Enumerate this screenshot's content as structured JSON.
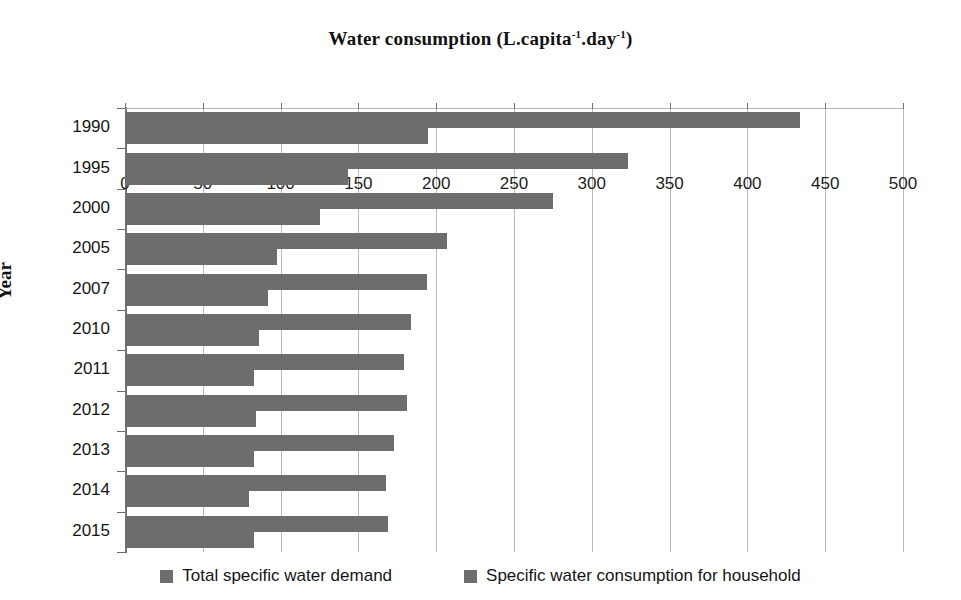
{
  "chart_data": {
    "type": "bar",
    "orientation": "horizontal",
    "title": "Water consumption (L.capita-1.day-1)",
    "title_parts": {
      "main": "Water consumption (L.capita",
      "sup1": "-1",
      "mid": ".day",
      "sup2": "-1",
      "end": ")"
    },
    "xlabel": "Water consumption (L.capita-1.day-1)",
    "ylabel": "Year",
    "xlim": [
      0,
      500
    ],
    "ylim_categories": [
      "1990",
      "1995",
      "2000",
      "2005",
      "2007",
      "2010",
      "2011",
      "2012",
      "2013",
      "2014",
      "2015"
    ],
    "categories": [
      "1990",
      "1995",
      "2000",
      "2005",
      "2007",
      "2010",
      "2011",
      "2012",
      "2013",
      "2014",
      "2015"
    ],
    "xticks": [
      0,
      50,
      100,
      150,
      200,
      250,
      300,
      350,
      400,
      450,
      500
    ],
    "xtick_labels": [
      "0",
      "50",
      "100",
      "150",
      "200",
      "250",
      "300",
      "350",
      "400",
      "450",
      "500"
    ],
    "grid": "vertical",
    "legend_position": "bottom",
    "series": [
      {
        "name": "Total specific water demand",
        "color": "#6d6d6d",
        "values": [
          434,
          323,
          275,
          207,
          194,
          184,
          179,
          181,
          173,
          168,
          169
        ]
      },
      {
        "name": "Specific water consumption for household",
        "color": "#6d6d6d",
        "values": [
          195,
          143,
          125,
          98,
          92,
          86,
          83,
          84,
          83,
          80,
          83
        ]
      }
    ]
  },
  "legend": {
    "items": [
      {
        "label": "Total specific water demand",
        "color": "#6d6d6d"
      },
      {
        "label": "Specific water consumption for household",
        "color": "#6d6d6d"
      }
    ]
  },
  "colors": {
    "bar": "#6d6d6d",
    "grid": "#b9b9b9",
    "axis": "#6f6f6f",
    "background": "#ffffff",
    "text": "#151515"
  }
}
